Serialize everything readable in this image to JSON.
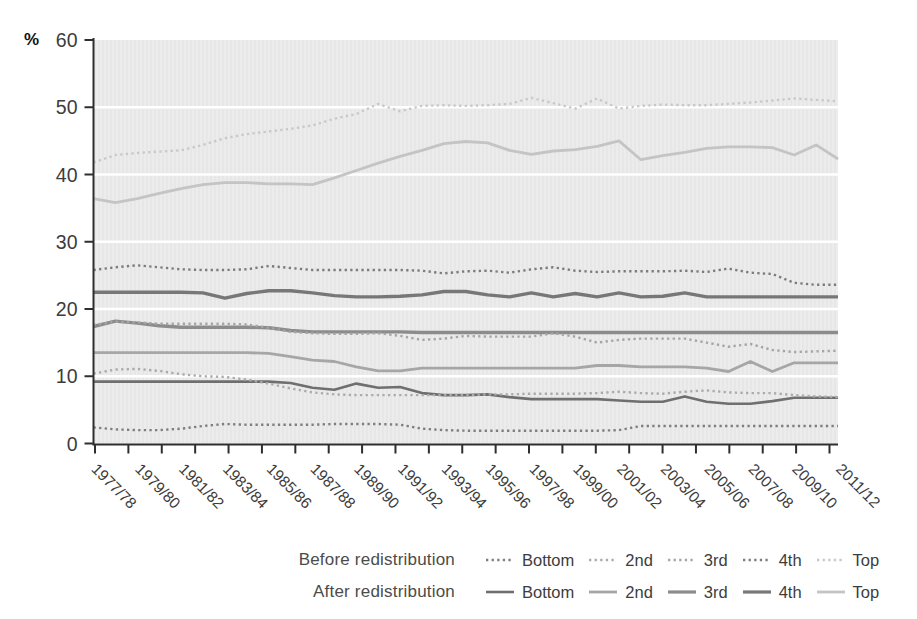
{
  "chart_data": {
    "type": "line",
    "title": "",
    "ylabel": "%",
    "ylim": [
      0,
      60
    ],
    "yticks": [
      0,
      10,
      20,
      30,
      40,
      50,
      60
    ],
    "grid": "horizontal white gridlines every 10 on light grey plot background",
    "x_tick_labels": [
      "1977/78",
      "1979/80",
      "1981/82",
      "1983/84",
      "1985/86",
      "1987/88",
      "1989/90",
      "1991/92",
      "1993/94",
      "1995/96",
      "1997/98",
      "1999/00",
      "2001/02",
      "2003/04",
      "2005/06",
      "2007/08",
      "2009/10",
      "2011/12"
    ],
    "x_points": 35,
    "legend": {
      "position": "bottom",
      "rows": [
        {
          "label": "Before redistribution",
          "style": "dotted",
          "items": [
            "Bottom",
            "2nd",
            "3rd",
            "4th",
            "Top"
          ]
        },
        {
          "label": "After redistribution",
          "style": "solid",
          "items": [
            "Bottom",
            "2nd",
            "3rd",
            "4th",
            "Top"
          ]
        }
      ]
    },
    "series": [
      {
        "group": "After redistribution",
        "quintile": "Bottom",
        "style": "solid",
        "color": "#6f6f6f",
        "width": 2.6,
        "values": [
          9.2,
          9.2,
          9.2,
          9.2,
          9.2,
          9.2,
          9.2,
          9.2,
          9.2,
          9.0,
          8.3,
          8.0,
          8.9,
          8.3,
          8.4,
          7.5,
          7.2,
          7.2,
          7.3,
          6.9,
          6.6,
          6.6,
          6.6,
          6.6,
          6.4,
          6.2,
          6.2,
          7.0,
          6.2,
          5.9,
          5.9,
          6.3,
          6.8,
          6.8,
          6.8
        ]
      },
      {
        "group": "After redistribution",
        "quintile": "2nd",
        "style": "solid",
        "color": "#a6a6a6",
        "width": 2.8,
        "values": [
          13.5,
          13.5,
          13.5,
          13.5,
          13.5,
          13.5,
          13.5,
          13.5,
          13.4,
          12.9,
          12.4,
          12.2,
          11.4,
          10.8,
          10.8,
          11.2,
          11.2,
          11.2,
          11.2,
          11.2,
          11.2,
          11.2,
          11.2,
          11.6,
          11.6,
          11.4,
          11.4,
          11.4,
          11.2,
          10.7,
          12.2,
          10.7,
          12.0,
          12.0,
          12.0
        ]
      },
      {
        "group": "After redistribution",
        "quintile": "3rd",
        "style": "solid",
        "color": "#8c8c8c",
        "width": 3.4,
        "values": [
          17.4,
          18.2,
          17.9,
          17.5,
          17.3,
          17.3,
          17.3,
          17.3,
          17.2,
          16.8,
          16.6,
          16.6,
          16.6,
          16.6,
          16.6,
          16.5,
          16.5,
          16.5,
          16.5,
          16.5,
          16.5,
          16.5,
          16.5,
          16.5,
          16.5,
          16.5,
          16.5,
          16.5,
          16.5,
          16.5,
          16.5,
          16.5,
          16.5,
          16.5,
          16.5
        ]
      },
      {
        "group": "After redistribution",
        "quintile": "4th",
        "style": "solid",
        "color": "#777777",
        "width": 3.4,
        "values": [
          22.5,
          22.5,
          22.5,
          22.5,
          22.5,
          22.4,
          21.6,
          22.3,
          22.7,
          22.7,
          22.4,
          22.0,
          21.8,
          21.8,
          21.9,
          22.1,
          22.6,
          22.6,
          22.1,
          21.8,
          22.4,
          21.8,
          22.3,
          21.8,
          22.4,
          21.8,
          21.9,
          22.4,
          21.8,
          21.8,
          21.8,
          21.8,
          21.8,
          21.8,
          21.8
        ]
      },
      {
        "group": "After redistribution",
        "quintile": "Top",
        "style": "solid",
        "color": "#c4c4c4",
        "width": 2.8,
        "values": [
          36.4,
          35.8,
          36.4,
          37.2,
          37.9,
          38.5,
          38.8,
          38.8,
          38.6,
          38.6,
          38.5,
          39.5,
          40.6,
          41.7,
          42.7,
          43.6,
          44.6,
          44.9,
          44.7,
          43.6,
          43.0,
          43.5,
          43.7,
          44.2,
          45.0,
          42.2,
          42.8,
          43.3,
          43.9,
          44.1,
          44.1,
          44.0,
          42.9,
          44.4,
          42.3
        ]
      },
      {
        "group": "Before redistribution",
        "quintile": "Bottom",
        "style": "dotted",
        "color": "#7e7e7e",
        "width": 2.4,
        "values": [
          2.4,
          2.1,
          2.0,
          2.0,
          2.2,
          2.6,
          2.9,
          2.8,
          2.8,
          2.8,
          2.8,
          2.9,
          2.9,
          2.9,
          2.8,
          2.2,
          2.0,
          1.9,
          1.9,
          1.9,
          1.9,
          1.9,
          1.9,
          1.9,
          2.0,
          2.6,
          2.6,
          2.6,
          2.6,
          2.6,
          2.6,
          2.6,
          2.6,
          2.6,
          2.6
        ]
      },
      {
        "group": "Before redistribution",
        "quintile": "2nd",
        "style": "dotted",
        "color": "#ababab",
        "width": 2.4,
        "values": [
          10.4,
          11.0,
          11.1,
          10.8,
          10.3,
          10.0,
          9.9,
          9.5,
          8.9,
          8.2,
          7.6,
          7.3,
          7.2,
          7.2,
          7.2,
          7.2,
          7.2,
          7.2,
          7.3,
          7.3,
          7.4,
          7.4,
          7.4,
          7.5,
          7.7,
          7.5,
          7.4,
          7.7,
          7.9,
          7.6,
          7.5,
          7.5,
          7.2,
          7.0,
          6.9
        ]
      },
      {
        "group": "Before redistribution",
        "quintile": "3rd",
        "style": "dotted",
        "color": "#a5a5a5",
        "width": 2.4,
        "values": [
          17.6,
          18.1,
          18.0,
          17.8,
          17.8,
          17.8,
          17.8,
          17.7,
          17.2,
          16.6,
          16.4,
          16.3,
          16.3,
          16.4,
          16.0,
          15.4,
          15.6,
          16.0,
          15.9,
          15.9,
          15.9,
          16.4,
          15.9,
          15.0,
          15.4,
          15.6,
          15.6,
          15.6,
          15.0,
          14.4,
          14.8,
          13.9,
          13.6,
          13.7,
          13.8
        ]
      },
      {
        "group": "Before redistribution",
        "quintile": "4th",
        "style": "dotted",
        "color": "#7c7c7c",
        "width": 2.4,
        "values": [
          25.8,
          26.2,
          26.5,
          26.2,
          25.9,
          25.8,
          25.8,
          25.9,
          26.4,
          26.1,
          25.8,
          25.8,
          25.8,
          25.8,
          25.8,
          25.7,
          25.3,
          25.6,
          25.7,
          25.4,
          25.9,
          26.2,
          25.7,
          25.5,
          25.6,
          25.6,
          25.6,
          25.7,
          25.5,
          26.0,
          25.4,
          25.2,
          23.9,
          23.6,
          23.6
        ]
      },
      {
        "group": "Before redistribution",
        "quintile": "Top",
        "style": "dotted",
        "color": "#c8c8c8",
        "width": 2.4,
        "values": [
          41.8,
          42.9,
          43.2,
          43.4,
          43.6,
          44.4,
          45.4,
          46.0,
          46.4,
          46.8,
          47.3,
          48.3,
          49.0,
          50.5,
          49.4,
          50.2,
          50.3,
          50.2,
          50.3,
          50.5,
          51.4,
          50.6,
          49.8,
          51.3,
          49.8,
          50.2,
          50.4,
          50.3,
          50.3,
          50.5,
          50.7,
          51.0,
          51.3,
          51.1,
          50.9
        ]
      }
    ],
    "axis_color": "#2e2e2e",
    "gridline_color": "#ffffff",
    "plot_bg_color": "#ececec",
    "tick_label_color": "#3c3c3c"
  }
}
